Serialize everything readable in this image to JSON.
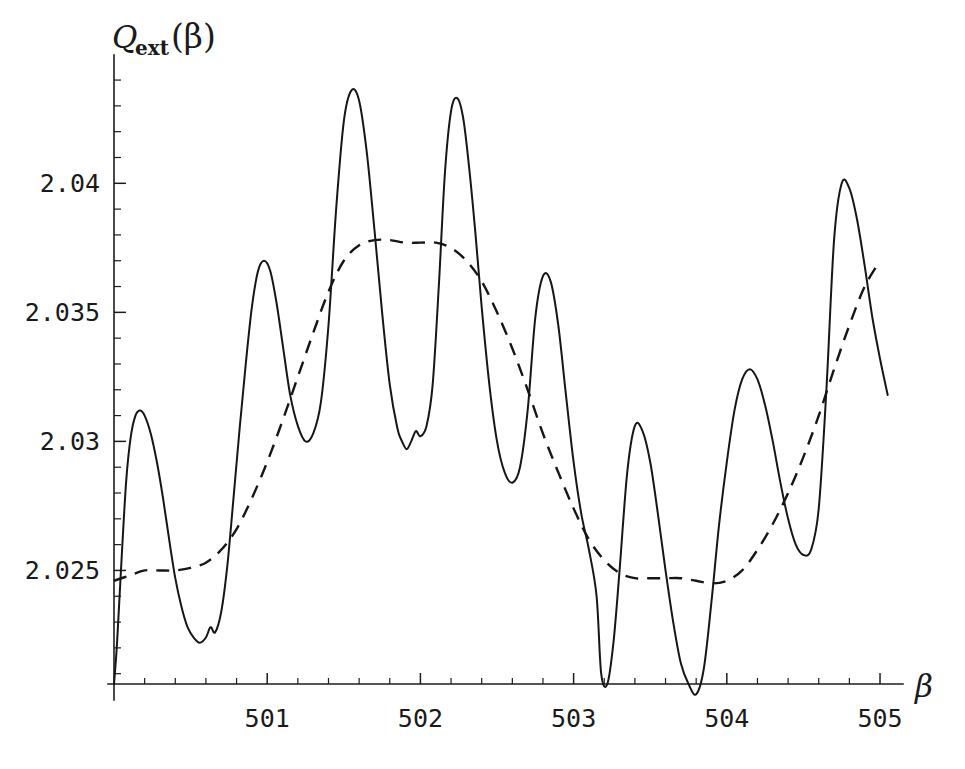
{
  "chart_data": {
    "type": "line",
    "title": "",
    "xlabel": "β",
    "ylabel": "Q_ext(β)",
    "ylabel_base": "Q",
    "ylabel_sub": "ext",
    "ylabel_arg": "(β)",
    "xlim": [
      500.0,
      505.15
    ],
    "ylim": [
      2.0206,
      2.0447
    ],
    "xticks": [
      501,
      502,
      503,
      504,
      505
    ],
    "xtick_labels": [
      "501",
      "502",
      "503",
      "504",
      "505"
    ],
    "yticks": [
      2.025,
      2.03,
      2.035,
      2.04
    ],
    "ytick_labels": [
      "2.025",
      "2.03",
      "2.035",
      "2.04"
    ],
    "xminor_step": 0.2,
    "yminor_step": 0.001,
    "grid": false,
    "legend": "none",
    "series": [
      {
        "name": "Q_ext exact (solid)",
        "style": "solid",
        "color": "#16161a",
        "x": [
          500.0,
          500.02,
          500.05,
          500.08,
          500.11,
          500.14,
          500.17,
          500.2,
          500.24,
          500.28,
          500.32,
          500.36,
          500.4,
          500.44,
          500.48,
          500.52,
          500.56,
          500.6,
          500.63,
          500.66,
          500.7,
          500.74,
          500.78,
          500.82,
          500.86,
          500.9,
          500.94,
          500.98,
          501.02,
          501.06,
          501.1,
          501.15,
          501.2,
          501.25,
          501.3,
          501.35,
          501.4,
          501.45,
          501.5,
          501.55,
          501.6,
          501.65,
          501.7,
          501.75,
          501.8,
          501.85,
          501.88,
          501.91,
          501.94,
          501.97,
          502.0,
          502.04,
          502.08,
          502.12,
          502.16,
          502.2,
          502.24,
          502.28,
          502.32,
          502.36,
          502.4,
          502.45,
          502.5,
          502.55,
          502.6,
          502.65,
          502.7,
          502.75,
          502.8,
          502.85,
          502.9,
          502.95,
          503.0,
          503.05,
          503.1,
          503.15,
          503.18,
          503.22,
          503.26,
          503.3,
          503.35,
          503.4,
          503.45,
          503.5,
          503.55,
          503.6,
          503.65,
          503.7,
          503.75,
          503.8,
          503.85,
          503.9,
          503.95,
          504.0,
          504.05,
          504.1,
          504.15,
          504.2,
          504.25,
          504.3,
          504.35,
          504.4,
          504.45,
          504.5,
          504.55,
          504.6,
          504.65,
          504.7,
          504.75,
          504.8,
          504.85,
          504.9,
          504.95,
          505.0,
          505.05
        ],
        "y": [
          2.0206,
          2.0222,
          2.0255,
          2.0285,
          2.0302,
          2.031,
          2.0312,
          2.031,
          2.0303,
          2.0292,
          2.0278,
          2.0262,
          2.0247,
          2.0236,
          2.0228,
          2.0224,
          2.0222,
          2.0224,
          2.0228,
          2.0226,
          2.0234,
          2.0252,
          2.0278,
          2.0305,
          2.033,
          2.0352,
          2.0366,
          2.037,
          2.0366,
          2.0354,
          2.0338,
          2.0318,
          2.0306,
          2.03,
          2.0303,
          2.0315,
          2.0345,
          2.039,
          2.0424,
          2.0436,
          2.0432,
          2.0412,
          2.0382,
          2.035,
          2.0322,
          2.0305,
          2.03,
          2.0297,
          2.03,
          2.0304,
          2.0302,
          2.0306,
          2.0322,
          2.036,
          2.0404,
          2.0428,
          2.0433,
          2.0425,
          2.0405,
          2.038,
          2.0352,
          2.0322,
          2.03,
          2.0288,
          2.0284,
          2.029,
          2.0312,
          2.0348,
          2.0364,
          2.0362,
          2.0345,
          2.0318,
          2.0292,
          2.0272,
          2.0258,
          2.024,
          2.021,
          2.0206,
          2.0222,
          2.025,
          2.0288,
          2.0306,
          2.0304,
          2.0292,
          2.0272,
          2.025,
          2.023,
          2.0214,
          2.0206,
          2.0202,
          2.0212,
          2.0238,
          2.0268,
          2.0292,
          2.0312,
          2.0324,
          2.0328,
          2.0324,
          2.0314,
          2.03,
          2.0284,
          2.027,
          2.026,
          2.0256,
          2.0258,
          2.0274,
          2.032,
          2.0378,
          2.04,
          2.0398,
          2.0386,
          2.0368,
          2.0348,
          2.0332,
          2.0318
        ]
      },
      {
        "name": "smoothed average (dashed)",
        "style": "dashed",
        "color": "#16161a",
        "x": [
          500.0,
          500.1,
          500.2,
          500.3,
          500.4,
          500.5,
          500.6,
          500.7,
          500.8,
          500.9,
          501.0,
          501.1,
          501.2,
          501.3,
          501.4,
          501.5,
          501.6,
          501.7,
          501.8,
          501.9,
          502.0,
          502.1,
          502.2,
          502.3,
          502.4,
          502.5,
          502.6,
          502.7,
          502.8,
          502.9,
          503.0,
          503.1,
          503.2,
          503.3,
          503.4,
          503.5,
          503.6,
          503.7,
          503.8,
          503.9,
          504.0,
          504.1,
          504.2,
          504.3,
          504.4,
          504.5,
          504.6,
          504.7,
          504.8,
          504.9,
          505.0
        ],
        "y": [
          2.0246,
          2.0248,
          2.025,
          2.025,
          2.025,
          2.0251,
          2.0253,
          2.0258,
          2.0266,
          2.0278,
          2.0292,
          2.0308,
          2.0325,
          2.0342,
          2.0358,
          2.037,
          2.0376,
          2.0378,
          2.0378,
          2.0377,
          2.0377,
          2.0377,
          2.0375,
          2.037,
          2.0362,
          2.035,
          2.0336,
          2.032,
          2.0303,
          2.0288,
          2.0274,
          2.0262,
          2.0254,
          2.0249,
          2.0247,
          2.0247,
          2.0247,
          2.0247,
          2.0246,
          2.0245,
          2.0246,
          2.025,
          2.0258,
          2.0268,
          2.028,
          2.0294,
          2.031,
          2.0328,
          2.0345,
          2.036,
          2.037
        ]
      }
    ],
    "notes": {
      "peak_positions_solid": [
        500.17,
        500.98,
        501.55,
        502.24,
        502.75,
        503.4,
        504.15,
        504.72
      ],
      "peak_values_solid": [
        2.0312,
        2.037,
        2.0436,
        2.0433,
        2.0364,
        2.0306,
        2.0328,
        2.04
      ],
      "minima_touching_axis": [
        503.18,
        503.8
      ],
      "dashed_plateau_max": 2.0378,
      "dashed_plateau_min": 2.0246
    }
  },
  "axes": {
    "y_axis_label_text": "Q",
    "y_axis_label_subscript": "ext",
    "y_axis_label_argument": "(β)",
    "x_axis_label": "β"
  }
}
